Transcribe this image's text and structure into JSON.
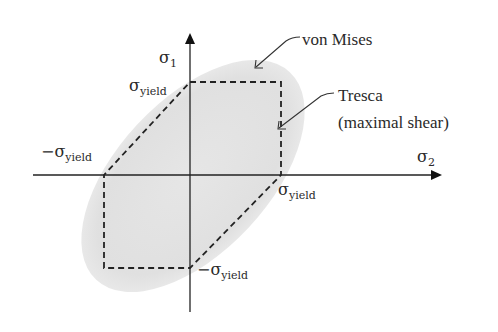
{
  "diagram": {
    "type": "yield-criteria",
    "axes": {
      "vertical": {
        "symbol": "σ",
        "subscript": "1"
      },
      "horizontal": {
        "symbol": "σ",
        "subscript": "2"
      }
    },
    "labels": {
      "top_yield": {
        "prefix": "",
        "symbol": "σ",
        "subscript": "yield"
      },
      "left_yield": {
        "prefix": "−",
        "symbol": "σ",
        "subscript": "yield"
      },
      "right_yield": {
        "prefix": "",
        "symbol": "σ",
        "subscript": "yield"
      },
      "bottom_yield": {
        "prefix": "−",
        "symbol": "σ",
        "subscript": "yield"
      }
    },
    "annotations": {
      "von_mises": "von Mises",
      "tresca_line1": "Tresca",
      "tresca_line2": "(maximal shear)"
    },
    "colors": {
      "ellipse_fill": "#e3e3e3",
      "lines": "#222222",
      "background": "#ffffff"
    }
  }
}
